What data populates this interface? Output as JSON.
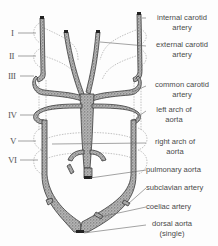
{
  "figure": {
    "arch_numerals": [
      {
        "id": "I",
        "label": "I",
        "y": 29
      },
      {
        "id": "II",
        "label": "II",
        "y": 52
      },
      {
        "id": "III",
        "label": "III",
        "y": 72
      },
      {
        "id": "IV",
        "label": "IV",
        "y": 111
      },
      {
        "id": "V",
        "label": "V",
        "y": 137
      },
      {
        "id": "VI",
        "label": "VI",
        "y": 156
      }
    ],
    "labels": [
      {
        "id": "internal-carotid-artery",
        "line1": "internal carotid",
        "line2": "artery"
      },
      {
        "id": "external-carotid-artery",
        "line1": "external carotid",
        "line2": "artery"
      },
      {
        "id": "common-carotid-artery",
        "line1": "common carotid",
        "line2": "artery"
      },
      {
        "id": "left-arch-of-aorta",
        "line1": "left arch of",
        "line2": "aorta"
      },
      {
        "id": "right-arch-of-aorta",
        "line1": "right arch of",
        "line2": "aorta"
      },
      {
        "id": "pulmonary-aorta",
        "line1": "pulmonary aorta"
      },
      {
        "id": "subclavian-artery",
        "line1": "subclavian artery"
      },
      {
        "id": "coeliac-artery",
        "line1": "coeliac artery"
      },
      {
        "id": "dorsal-aorta",
        "line1": "dorsal aorta",
        "line2": "(single)"
      }
    ],
    "colors": {
      "vessel_fill": "#9a9a9a",
      "vessel_outline": "#3a3a3a",
      "dotted_outline": "#9a9a9a",
      "leader_line": "#666666",
      "text": "#4a4a4a"
    }
  }
}
